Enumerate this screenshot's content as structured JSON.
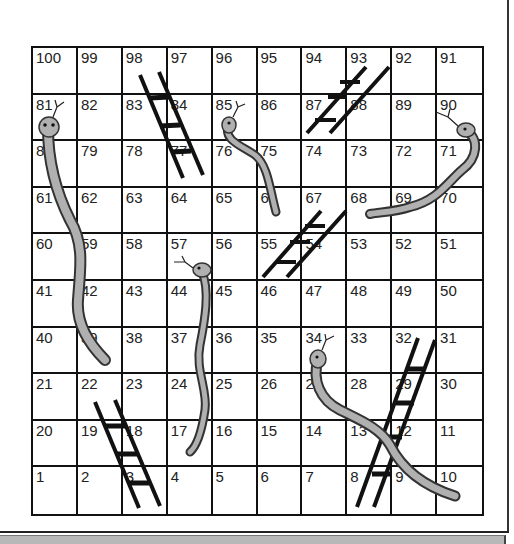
{
  "game": {
    "title": "Snakes and Ladders",
    "rows": [
      [
        100,
        99,
        98,
        97,
        96,
        95,
        94,
        93,
        92,
        91
      ],
      [
        81,
        82,
        83,
        84,
        85,
        86,
        87,
        88,
        89,
        90
      ],
      [
        80,
        79,
        78,
        77,
        76,
        75,
        74,
        73,
        72,
        71
      ],
      [
        61,
        62,
        63,
        64,
        65,
        66,
        67,
        68,
        69,
        70
      ],
      [
        60,
        59,
        58,
        57,
        56,
        55,
        54,
        53,
        52,
        51
      ],
      [
        41,
        42,
        43,
        44,
        45,
        46,
        47,
        48,
        49,
        50
      ],
      [
        40,
        39,
        38,
        37,
        36,
        35,
        34,
        33,
        32,
        31
      ],
      [
        21,
        22,
        23,
        24,
        25,
        26,
        27,
        28,
        29,
        30
      ],
      [
        20,
        19,
        18,
        17,
        16,
        15,
        14,
        13,
        12,
        11
      ],
      [
        1,
        2,
        3,
        4,
        5,
        6,
        7,
        8,
        9,
        10
      ]
    ],
    "ladders": [
      {
        "name": "ladder-3-to-18",
        "from": 3,
        "to": 19
      },
      {
        "name": "ladder-8-to-32",
        "from": 8,
        "to": 32
      },
      {
        "name": "ladder-55-to-67",
        "from": 55,
        "to": 68
      },
      {
        "name": "ladder-77-to-98",
        "from": 77,
        "to": 98
      },
      {
        "name": "ladder-87-to-93",
        "from": 87,
        "to": 93
      }
    ],
    "snakes": [
      {
        "name": "snake-81-to-39",
        "head": 81,
        "tail": 39
      },
      {
        "name": "snake-85-to-66",
        "head": 85,
        "tail": 66
      },
      {
        "name": "snake-90-to-68",
        "head": 90,
        "tail": 68
      },
      {
        "name": "snake-57-to-17",
        "head": 57,
        "tail": 17
      },
      {
        "name": "snake-34-to-10",
        "head": 34,
        "tail": 10
      }
    ],
    "colors": {
      "grid": "#111111",
      "snake_fill": "#b0b0b0",
      "snake_outline": "#333333",
      "ladder": "#111111"
    }
  }
}
